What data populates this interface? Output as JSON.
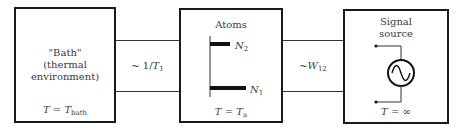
{
  "diagram": {
    "type": "block-diagram",
    "boxes": [
      {
        "id": "bath",
        "title_lines": [
          "\"Bath\"",
          "(thermal",
          "environment)"
        ],
        "temperature": {
          "lhs": "T",
          "eq": "=",
          "rhs": "T",
          "rhs_sub": "bath"
        }
      },
      {
        "id": "atoms",
        "title": "Atoms",
        "levels": [
          {
            "label": "N",
            "sub": "2"
          },
          {
            "label": "N",
            "sub": "1"
          }
        ],
        "temperature": {
          "lhs": "T",
          "eq": "=",
          "rhs": "T",
          "rhs_sub": "a"
        }
      },
      {
        "id": "signal-source",
        "title_lines": [
          "Signal",
          "source"
        ],
        "symbol": "ac-source-icon",
        "temperature": {
          "lhs": "T",
          "eq": "=",
          "rhs": "∞"
        }
      }
    ],
    "links": [
      {
        "from": "bath",
        "to": "atoms",
        "label_prefix": "~ 1/",
        "label_var": "T",
        "label_sub": "1"
      },
      {
        "from": "atoms",
        "to": "signal-source",
        "label_prefix": "~",
        "label_var": "W",
        "label_sub": "12"
      }
    ]
  }
}
